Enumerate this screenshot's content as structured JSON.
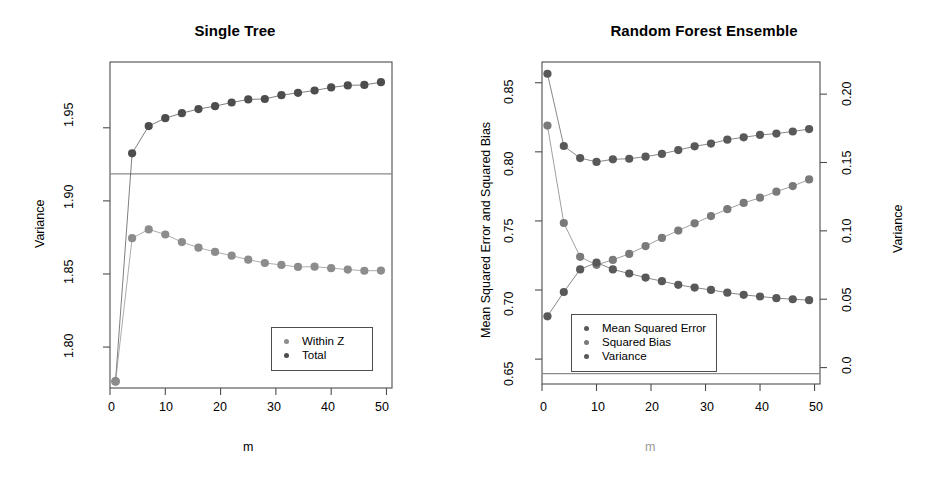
{
  "figure": {
    "background": "#ffffff",
    "panels": [
      "Single Tree",
      "Random Forest Ensemble"
    ]
  },
  "left_panel": {
    "title": "Single Tree",
    "xlabel": "m",
    "ylabel": "Variance",
    "xticks": [
      "0",
      "10",
      "20",
      "30",
      "40",
      "50"
    ],
    "yticks": [
      "1.80",
      "1.85",
      "1.90",
      "1.95"
    ],
    "legend": {
      "items": [
        {
          "label": "Within Z",
          "color": "#8c8c8c"
        },
        {
          "label": "Total",
          "color": "#4d4d4d"
        }
      ]
    }
  },
  "right_panel": {
    "title": "Random Forest Ensemble",
    "xlabel": "m",
    "ylabel_left": "Mean Squared Error and Squared Bias",
    "ylabel_right": "Variance",
    "xticks": [
      "0",
      "10",
      "20",
      "30",
      "40",
      "50"
    ],
    "yticks_left": [
      "0.65",
      "0.70",
      "0.75",
      "0.80",
      "0.85"
    ],
    "yticks_right": [
      "0.0",
      "0.05",
      "0.10",
      "0.15",
      "0.20"
    ],
    "legend": {
      "items": [
        {
          "label": "Mean Squared Error",
          "color": "#595959"
        },
        {
          "label": "Squared Bias",
          "color": "#7a7a7a"
        },
        {
          "label": "Variance",
          "color": "#595959"
        }
      ]
    }
  },
  "chart_data": [
    {
      "type": "scatter",
      "title": "Single Tree",
      "xlabel": "m",
      "ylabel": "Variance",
      "xlim": [
        0,
        51
      ],
      "ylim": [
        1.772,
        1.995
      ],
      "xticks": [
        0,
        10,
        20,
        30,
        40,
        50
      ],
      "yticks": [
        1.8,
        1.85,
        1.9,
        1.95
      ],
      "grid": false,
      "legend_position": "bottom-right",
      "hline": 1.9185,
      "x": [
        1,
        4,
        7,
        10,
        13,
        16,
        19,
        22,
        25,
        28,
        31,
        34,
        37,
        40,
        43,
        46,
        49
      ],
      "series": [
        {
          "name": "Total",
          "color": "#4d4d4d",
          "values": [
            1.7765,
            1.9325,
            1.9512,
            1.9566,
            1.96,
            1.9628,
            1.9648,
            1.9673,
            1.9694,
            1.9697,
            1.9723,
            1.9739,
            1.9755,
            1.9776,
            1.979,
            1.9793,
            1.9812
          ]
        },
        {
          "name": "Within Z",
          "color": "#8c8c8c",
          "values": [
            1.7765,
            1.8745,
            1.8805,
            1.877,
            1.8718,
            1.868,
            1.8651,
            1.8625,
            1.8598,
            1.8575,
            1.8562,
            1.8548,
            1.855,
            1.854,
            1.853,
            1.8522,
            1.8523
          ]
        }
      ]
    },
    {
      "type": "scatter",
      "title": "Random Forest Ensemble",
      "xlabel": "m",
      "ylabel": "Mean Squared Error and Squared Bias",
      "ylabel_secondary": "Variance",
      "xlim": [
        0,
        51
      ],
      "ylim": [
        0.632,
        0.865
      ],
      "ylim_secondary": [
        -0.012,
        0.2235
      ],
      "xticks": [
        0,
        10,
        20,
        30,
        40,
        50
      ],
      "yticks": [
        0.65,
        0.7,
        0.75,
        0.8,
        0.85
      ],
      "yticks_secondary": [
        0.0,
        0.05,
        0.1,
        0.15,
        0.2
      ],
      "grid": false,
      "legend_position": "bottom-left",
      "hline": 0.6395,
      "x": [
        1,
        4,
        7,
        10,
        13,
        16,
        19,
        22,
        25,
        28,
        31,
        34,
        37,
        40,
        43,
        46,
        49
      ],
      "series": [
        {
          "name": "Mean Squared Error",
          "axis": "left",
          "color": "#595959",
          "values": [
            0.8565,
            0.8042,
            0.7955,
            0.7927,
            0.7946,
            0.795,
            0.7965,
            0.7985,
            0.8013,
            0.804,
            0.806,
            0.8088,
            0.8105,
            0.8122,
            0.8132,
            0.8147,
            0.8165
          ]
        },
        {
          "name": "Squared Bias",
          "axis": "left",
          "color": "#7a7a7a",
          "values": [
            0.819,
            0.7485,
            0.724,
            0.7182,
            0.7218,
            0.7262,
            0.7318,
            0.7377,
            0.743,
            0.7483,
            0.7535,
            0.7585,
            0.763,
            0.7668,
            0.7712,
            0.7752,
            0.78
          ]
        },
        {
          "name": "Variance",
          "axis": "right",
          "color": "#595959",
          "values": [
            0.0375,
            0.0553,
            0.0718,
            0.0768,
            0.0718,
            0.0688,
            0.0658,
            0.0632,
            0.0605,
            0.0585,
            0.0568,
            0.0548,
            0.0532,
            0.052,
            0.0508,
            0.05,
            0.0493
          ]
        }
      ]
    }
  ]
}
